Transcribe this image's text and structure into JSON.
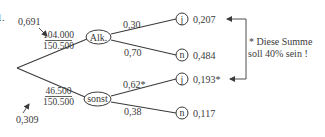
{
  "diagram": {
    "item_number": "1.",
    "root_to_branches": {
      "alk": {
        "node_label": "Alk.",
        "probability": "0,691",
        "fraction_numerator": "104.000",
        "fraction_denominator": "150.500"
      },
      "sonst": {
        "node_label": "sonst",
        "probability": "0,309",
        "fraction_numerator": "46.500",
        "fraction_denominator": "150.500"
      }
    },
    "leaves": [
      {
        "parent": "Alk.",
        "node_label": "j",
        "edge_label": "0,30",
        "path_probability": "0,207"
      },
      {
        "parent": "Alk.",
        "node_label": "n",
        "edge_label": "0,70",
        "path_probability": "0,484"
      },
      {
        "parent": "sonst",
        "node_label": "j",
        "edge_label": "0,62*",
        "path_probability": "0,193*"
      },
      {
        "parent": "sonst",
        "node_label": "n",
        "edge_label": "0,38",
        "path_probability": "0,117"
      }
    ],
    "note": {
      "line1": "* Diese Summe",
      "line2": "soll 40% sein !"
    },
    "colors": {
      "ink": "#3a3a3a",
      "background": "#ffffff"
    }
  }
}
